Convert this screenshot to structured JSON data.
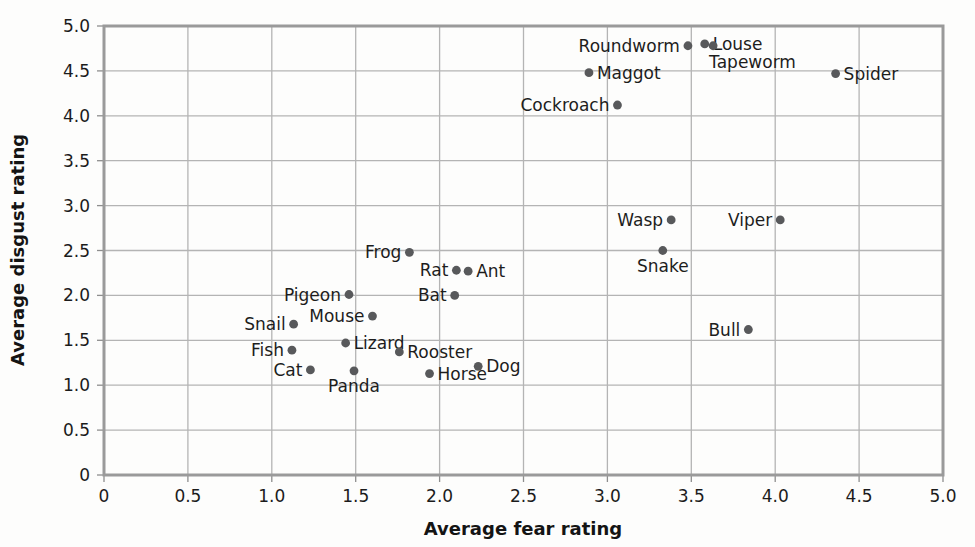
{
  "chart_data": {
    "type": "scatter",
    "title": "",
    "xlabel": "Average fear rating",
    "ylabel": "Average disgust rating",
    "xlim": [
      0,
      5
    ],
    "ylim": [
      0,
      5
    ],
    "xticks": [
      "0",
      "0.5",
      "1.0",
      "1.5",
      "2.0",
      "2.5",
      "3.0",
      "3.5",
      "4.0",
      "4.5",
      "5.0"
    ],
    "yticks": [
      "0",
      "0.5",
      "1.0",
      "1.5",
      "2.0",
      "2.5",
      "3.0",
      "3.5",
      "4.0",
      "4.5",
      "5.0"
    ],
    "grid": true,
    "legend": "none",
    "points": [
      {
        "label": "Roundworm",
        "x": 3.48,
        "y": 4.78,
        "pos": "left"
      },
      {
        "label": "Louse",
        "x": 3.58,
        "y": 4.8,
        "pos": "right"
      },
      {
        "label": "Tapeworm",
        "x": 3.63,
        "y": 4.78,
        "pos": "below-right"
      },
      {
        "label": "Maggot",
        "x": 2.89,
        "y": 4.48,
        "pos": "right"
      },
      {
        "label": "Spider",
        "x": 4.36,
        "y": 4.47,
        "pos": "right"
      },
      {
        "label": "Cockroach",
        "x": 3.06,
        "y": 4.12,
        "pos": "left"
      },
      {
        "label": "Wasp",
        "x": 3.38,
        "y": 2.84,
        "pos": "left"
      },
      {
        "label": "Viper",
        "x": 4.03,
        "y": 2.84,
        "pos": "left"
      },
      {
        "label": "Snake",
        "x": 3.33,
        "y": 2.5,
        "pos": "below"
      },
      {
        "label": "Frog",
        "x": 1.82,
        "y": 2.48,
        "pos": "left"
      },
      {
        "label": "Rat",
        "x": 2.1,
        "y": 2.28,
        "pos": "left"
      },
      {
        "label": "Ant",
        "x": 2.17,
        "y": 2.27,
        "pos": "right"
      },
      {
        "label": "Pigeon",
        "x": 1.46,
        "y": 2.01,
        "pos": "left"
      },
      {
        "label": "Bat",
        "x": 2.09,
        "y": 2.0,
        "pos": "left"
      },
      {
        "label": "Mouse",
        "x": 1.6,
        "y": 1.77,
        "pos": "left"
      },
      {
        "label": "Snail",
        "x": 1.13,
        "y": 1.68,
        "pos": "left"
      },
      {
        "label": "Bull",
        "x": 3.84,
        "y": 1.62,
        "pos": "left"
      },
      {
        "label": "Lizard",
        "x": 1.44,
        "y": 1.47,
        "pos": "right"
      },
      {
        "label": "Fish",
        "x": 1.12,
        "y": 1.39,
        "pos": "left"
      },
      {
        "label": "Rooster",
        "x": 1.76,
        "y": 1.37,
        "pos": "right"
      },
      {
        "label": "Dog",
        "x": 2.23,
        "y": 1.21,
        "pos": "right"
      },
      {
        "label": "Cat",
        "x": 1.23,
        "y": 1.17,
        "pos": "left"
      },
      {
        "label": "Panda",
        "x": 1.49,
        "y": 1.16,
        "pos": "below"
      },
      {
        "label": "Horse",
        "x": 1.94,
        "y": 1.13,
        "pos": "right"
      }
    ]
  }
}
